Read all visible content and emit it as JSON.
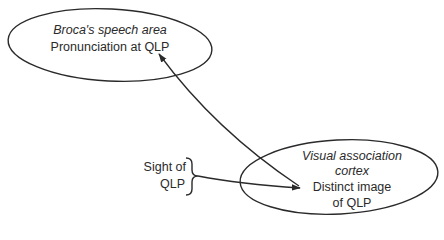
{
  "nodes": {
    "broca": {
      "title": "Broca's speech area",
      "subtitle": "Pronunciation at QLP"
    },
    "visual": {
      "title_line1": "Visual association",
      "title_line2": "cortex",
      "subtitle_line1": "Distinct image",
      "subtitle_line2": "of QLP"
    }
  },
  "input": {
    "line1": "Sight of",
    "line2": "QLP"
  },
  "edges": [
    {
      "from": "input",
      "to": "visual",
      "label": ""
    },
    {
      "from": "visual",
      "to": "broca",
      "label": ""
    }
  ],
  "colors": {
    "stroke": "#2a2a2a",
    "background": "#ffffff"
  }
}
